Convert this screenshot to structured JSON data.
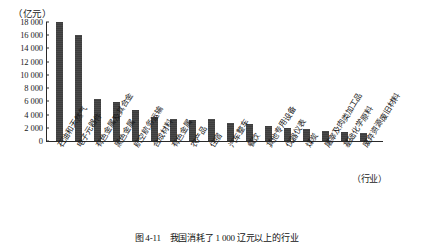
{
  "figure": {
    "caption": "图 4-11　我国消耗了 1 000 辽元以上的行业"
  },
  "chart_data": {
    "type": "bar",
    "title": "",
    "subtitle": "",
    "xlabel": "（行业）",
    "ylabel": "（亿元）",
    "unit_label": "（亿元）",
    "grid": false,
    "legend": false,
    "ylim": [
      0,
      18000
    ],
    "ytick_labels": [
      "18 000",
      "16 000",
      "14 000",
      "12 000",
      "10 000",
      "8 000",
      "6 000",
      "4 000",
      "2 000",
      "0"
    ],
    "ytick_values": [
      18000,
      16000,
      14000,
      12000,
      10000,
      8000,
      6000,
      4000,
      2000,
      0
    ],
    "categories": [
      "石油和天然气",
      "电子元器件",
      "有色金属及其合金",
      "黑色金属",
      "航空航务运输",
      "合成材料",
      "有色金属",
      "农产品",
      "住宿",
      "汽车整车",
      "餐饮",
      "其他专用设备",
      "仪器仪表",
      "煤炭",
      "屠宰及肉类加工品",
      "基础化学原料",
      "废弃资源废旧材料"
    ],
    "values": [
      18000,
      16000,
      6300,
      5900,
      4700,
      3700,
      3300,
      3200,
      3350,
      2750,
      2600,
      2200,
      1900,
      1750,
      1500,
      1350,
      1150
    ],
    "bar_color": "#3d3d3d",
    "axis_color": "#2a2a2a"
  }
}
